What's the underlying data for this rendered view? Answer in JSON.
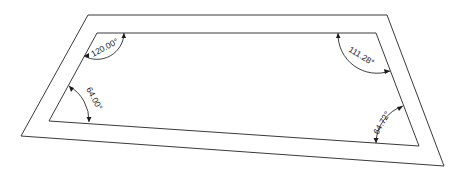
{
  "diagram": {
    "type": "trapezoid-frame-with-angle-dimensions",
    "colors": {
      "line": "#3a3a3a",
      "background": "#ffffff",
      "text": "#222222"
    },
    "outer_quad": {
      "tl": [
        88,
        15
      ],
      "tr": [
        387,
        15
      ],
      "br": [
        444,
        166
      ],
      "bl": [
        21,
        136
      ]
    },
    "inner_quad": {
      "tl": [
        97,
        33
      ],
      "tr": [
        376,
        33
      ],
      "br": [
        419,
        146
      ],
      "bl": [
        49,
        121
      ]
    },
    "angles": [
      {
        "id": "top-left",
        "label": "120.00°"
      },
      {
        "id": "top-right",
        "label": "111.28°"
      },
      {
        "id": "bottom-left",
        "label": "64.00°"
      },
      {
        "id": "bottom-right",
        "label": "64.72°"
      }
    ]
  }
}
